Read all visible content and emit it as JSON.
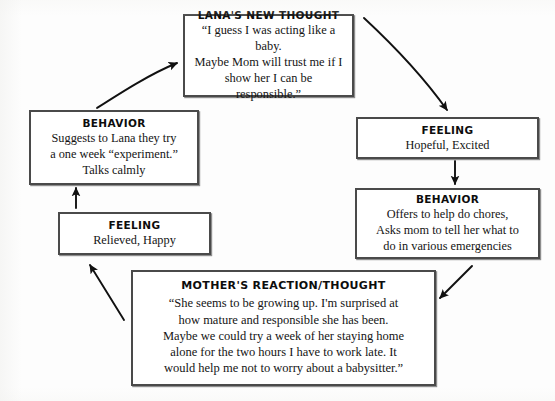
{
  "diagram": {
    "type": "cycle",
    "direction": "clockwise",
    "colors": {
      "box_border": "#4a4a4a",
      "box_fill": "#ffffff",
      "arrow": "#111111",
      "text": "#141414",
      "page_background": "#fdfdfd"
    },
    "nodes": [
      {
        "id": "lanas-new-thought",
        "title": "LANA'S NEW THOUGHT",
        "body": "“I guess I was acting like a baby.\nMaybe Mom will trust me if I\nshow her I can be responsible.”"
      },
      {
        "id": "feeling-right",
        "title": "FEELING",
        "body": "Hopeful, Excited"
      },
      {
        "id": "behavior-right",
        "title": "BEHAVIOR",
        "body": "Offers to help do chores,\nAsks mom to tell her what to\ndo in various emergencies"
      },
      {
        "id": "mothers-reaction-thought",
        "title": "MOTHER'S REACTION/THOUGHT",
        "body": "“She seems to be growing up. I'm surprised at\nhow mature and responsible she has been.\nMaybe we could try a week of her staying home\nalone for the two hours I have to work late. It\nwould help me not to worry about a babysitter.”"
      },
      {
        "id": "feeling-left",
        "title": "FEELING",
        "body": "Relieved, Happy"
      },
      {
        "id": "behavior-left",
        "title": "BEHAVIOR",
        "body": "Suggests to Lana they try\na one week “experiment.”\nTalks calmly"
      }
    ],
    "arrows": [
      {
        "id": "arrow-thought-to-feeling-right",
        "from": "lanas-new-thought",
        "to": "feeling-right",
        "shape": "curve-right-down"
      },
      {
        "id": "arrow-feeling-right-to-behavior-right",
        "from": "feeling-right",
        "to": "behavior-right",
        "shape": "straight-down"
      },
      {
        "id": "arrow-behavior-right-to-mother",
        "from": "behavior-right",
        "to": "mothers-reaction-thought",
        "shape": "diagonal-down-left"
      },
      {
        "id": "arrow-mother-to-feeling-left",
        "from": "mothers-reaction-thought",
        "to": "feeling-left",
        "shape": "diagonal-up-left"
      },
      {
        "id": "arrow-feeling-left-to-behavior-left",
        "from": "feeling-left",
        "to": "behavior-left",
        "shape": "straight-up"
      },
      {
        "id": "arrow-behavior-left-to-thought",
        "from": "behavior-left",
        "to": "lanas-new-thought",
        "shape": "curve-up-right"
      }
    ]
  }
}
